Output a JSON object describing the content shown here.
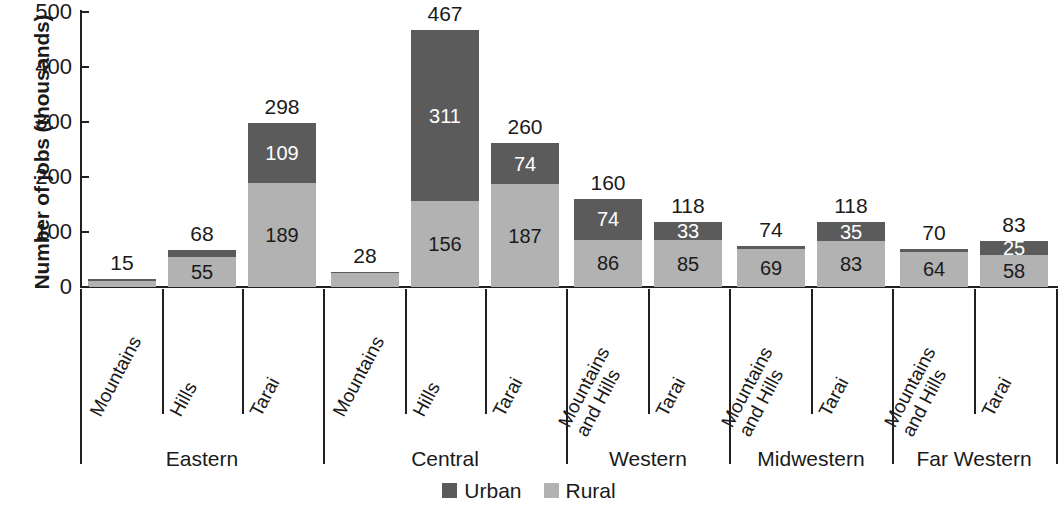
{
  "chart_data": {
    "type": "bar",
    "subtype": "stacked-bar",
    "title": "",
    "xlabel": "",
    "ylabel": "Number of jobs (thousands)",
    "ylim": [
      0,
      500
    ],
    "yticks": [
      0,
      100,
      200,
      300,
      400,
      500
    ],
    "grid": false,
    "legend_position": "bottom-center",
    "legend": [
      "Urban",
      "Rural"
    ],
    "colors": {
      "urban": "#5b5b5b",
      "rural": "#b2b2b2",
      "axis": "#231f20",
      "background": "#ffffff"
    },
    "categories": [
      "Mountains",
      "Hills",
      "Tarai",
      "Mountains",
      "Hills",
      "Tarai",
      "Mountains and Hills",
      "Tarai",
      "Mountains and Hills",
      "Tarai",
      "Mountains and Hills",
      "Tarai"
    ],
    "series": [
      {
        "name": "Urban",
        "values": [
          4,
          13,
          109,
          3,
          311,
          74,
          74,
          33,
          5,
          35,
          6,
          25
        ]
      },
      {
        "name": "Rural",
        "values": [
          11,
          55,
          189,
          25,
          156,
          187,
          86,
          85,
          69,
          83,
          64,
          58
        ]
      }
    ],
    "totals": [
      15,
      68,
      298,
      28,
      467,
      260,
      160,
      118,
      74,
      118,
      70,
      83
    ],
    "groups": [
      {
        "name": "Eastern",
        "categories": [
          "Mountains",
          "Hills",
          "Tarai"
        ]
      },
      {
        "name": "Central",
        "categories": [
          "Mountains",
          "Hills",
          "Tarai"
        ]
      },
      {
        "name": "Western",
        "categories": [
          "Mountains and Hills",
          "Tarai"
        ]
      },
      {
        "name": "Midwestern",
        "categories": [
          "Mountains and Hills",
          "Tarai"
        ]
      },
      {
        "name": "Far Western",
        "categories": [
          "Mountains and Hills",
          "Tarai"
        ]
      }
    ]
  },
  "axis": {
    "y_title": "Number of jobs (thousands)",
    "y_ticks": [
      "500",
      "400",
      "300",
      "200",
      "100",
      "0"
    ]
  },
  "bars": [
    {
      "group": "Eastern",
      "category": "Mountains",
      "label_lines": "Mountains",
      "total": "15",
      "urban": 4,
      "rural": 11,
      "urban_label": "",
      "rural_label": ""
    },
    {
      "group": "Eastern",
      "category": "Hills",
      "label_lines": "Hills",
      "total": "68",
      "urban": 13,
      "rural": 55,
      "urban_label": "",
      "rural_label": "55"
    },
    {
      "group": "Eastern",
      "category": "Tarai",
      "label_lines": "Tarai",
      "total": "298",
      "urban": 109,
      "rural": 189,
      "urban_label": "109",
      "rural_label": "189"
    },
    {
      "group": "Central",
      "category": "Mountains",
      "label_lines": "Mountains",
      "total": "28",
      "urban": 3,
      "rural": 25,
      "urban_label": "",
      "rural_label": ""
    },
    {
      "group": "Central",
      "category": "Hills",
      "label_lines": "Hills",
      "total": "467",
      "urban": 311,
      "rural": 156,
      "urban_label": "311",
      "rural_label": "156"
    },
    {
      "group": "Central",
      "category": "Tarai",
      "label_lines": "Tarai",
      "total": "260",
      "urban": 74,
      "rural": 187,
      "urban_label": "74",
      "rural_label": "187"
    },
    {
      "group": "Western",
      "category": "Mountains and Hills",
      "label_lines": "Mountains\nand Hills",
      "total": "160",
      "urban": 74,
      "rural": 86,
      "urban_label": "74",
      "rural_label": "86"
    },
    {
      "group": "Western",
      "category": "Tarai",
      "label_lines": "Tarai",
      "total": "118",
      "urban": 33,
      "rural": 85,
      "urban_label": "33",
      "rural_label": "85"
    },
    {
      "group": "Midwestern",
      "category": "Mountains and Hills",
      "label_lines": "Mountains\nand Hills",
      "total": "74",
      "urban": 5,
      "rural": 69,
      "urban_label": "",
      "rural_label": "69"
    },
    {
      "group": "Midwestern",
      "category": "Tarai",
      "label_lines": "Tarai",
      "total": "118",
      "urban": 35,
      "rural": 83,
      "urban_label": "35",
      "rural_label": "83"
    },
    {
      "group": "Far Western",
      "category": "Mountains and Hills",
      "label_lines": "Mountains\nand Hills",
      "total": "70",
      "urban": 6,
      "rural": 64,
      "urban_label": "",
      "rural_label": "64"
    },
    {
      "group": "Far Western",
      "category": "Tarai",
      "label_lines": "Tarai",
      "total": "83",
      "urban": 25,
      "rural": 58,
      "urban_label": "25",
      "rural_label": "58"
    }
  ],
  "regions": [
    {
      "name": "Eastern"
    },
    {
      "name": "Central"
    },
    {
      "name": "Western"
    },
    {
      "name": "Midwestern"
    },
    {
      "name": "Far Western"
    }
  ],
  "legend": {
    "items": [
      {
        "label": "Urban",
        "color": "#5b5b5b"
      },
      {
        "label": "Rural",
        "color": "#b2b2b2"
      }
    ]
  }
}
